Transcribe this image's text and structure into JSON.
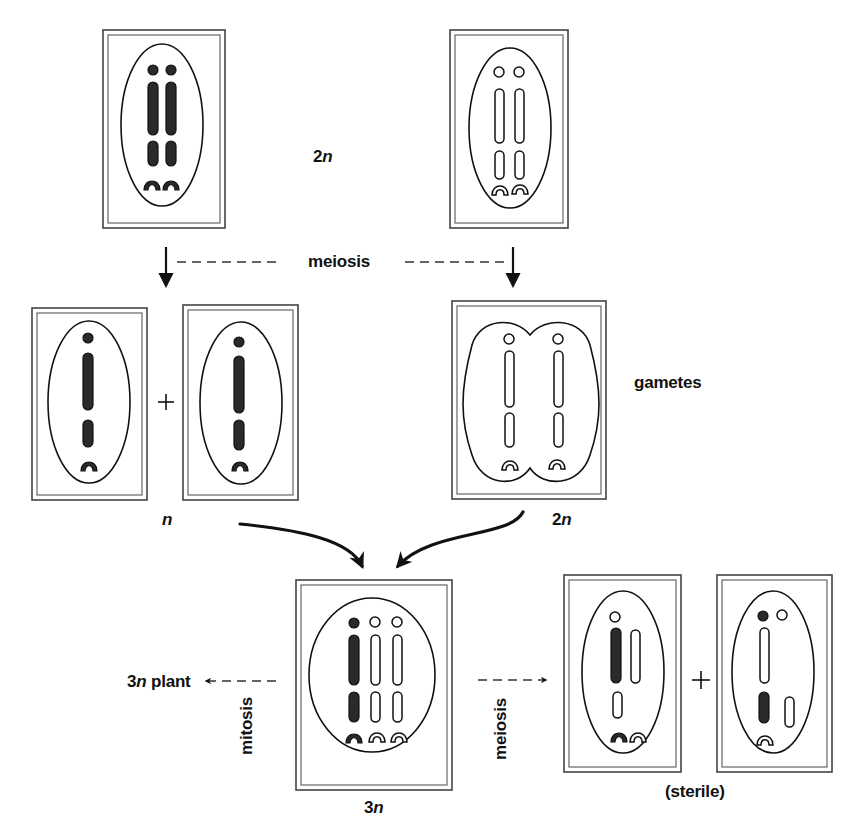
{
  "labels": {
    "top_ploidy": {
      "number": "2",
      "italic": "n"
    },
    "meiosis_top": "meiosis",
    "gametes": "gametes",
    "n_label": {
      "number": "",
      "italic": "n"
    },
    "two_n_label": {
      "number": "2",
      "italic": "n"
    },
    "three_n_label": {
      "number": "3",
      "italic": "n"
    },
    "plant_label": {
      "number": "3",
      "italic": "n",
      "suffix": " plant"
    },
    "mitosis": "mitosis",
    "meiosis_bottom": "meiosis",
    "sterile": "(sterile)",
    "plus_1": "+",
    "plus_2": "+"
  },
  "colors": {
    "ink": "#111111",
    "frame": "#444444",
    "background": "#ffffff",
    "dark_chromosome": "#2a2a2a"
  },
  "cells": [
    {
      "id": "parent-diploid-dark",
      "ploidy": "2n",
      "chromosome_style": "dark",
      "sets": 2
    },
    {
      "id": "parent-tetraploid-light",
      "ploidy": "2n gamete source",
      "chromosome_style": "light",
      "sets": 2
    },
    {
      "id": "gamete-n-1",
      "ploidy": "n",
      "chromosome_style": "dark",
      "sets": 1
    },
    {
      "id": "gamete-n-2",
      "ploidy": "n",
      "chromosome_style": "dark",
      "sets": 1
    },
    {
      "id": "gamete-2n",
      "ploidy": "2n",
      "chromosome_style": "light",
      "sets": 2
    },
    {
      "id": "zygote-3n",
      "ploidy": "3n",
      "chromosome_style": "mixed",
      "sets": 3
    },
    {
      "id": "sterile-gamete-1",
      "ploidy": "unbalanced",
      "chromosome_style": "mixed",
      "sets": 1
    },
    {
      "id": "sterile-gamete-2",
      "ploidy": "unbalanced",
      "chromosome_style": "mixed",
      "sets": 1
    }
  ]
}
